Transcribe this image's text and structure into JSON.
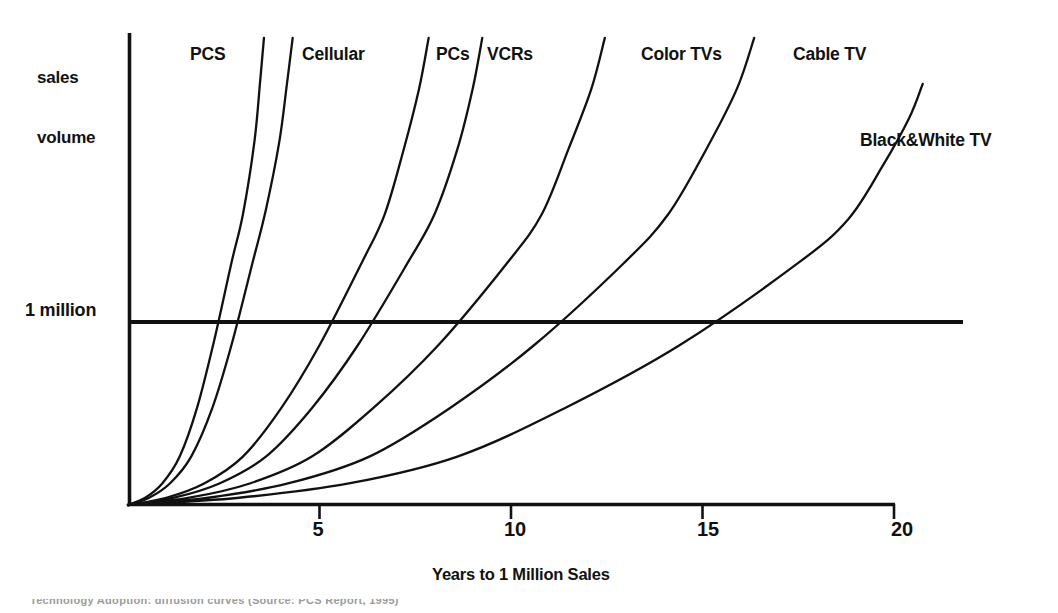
{
  "figure": {
    "y_axis_name_line1": "sales",
    "y_axis_name_line2": "volume",
    "y_reference_label": "1 million",
    "x_axis_title": "Years to 1 Million Sales",
    "bottom_caption": "Technology Adoption: diffusion curves (Source: PCS Report, 1995)"
  },
  "ticks": {
    "t5": "5",
    "t10": "10",
    "t15": "15",
    "t20": "20"
  },
  "labels": {
    "pcs": "PCS",
    "cellular": "Cellular",
    "pcs_computers": "PCs",
    "vcrs": "VCRs",
    "color_tvs": "Color TVs",
    "cable_tv": "Cable TV",
    "bw_tv": "Black&White TV"
  },
  "colors": {
    "ink": "#111111",
    "background": "#ffffff",
    "caption": "#9b9b9b"
  },
  "chart_data": {
    "type": "line",
    "title": "",
    "subtitle": "",
    "xlabel": "Years to 1 Million Sales",
    "ylabel": "sales volume",
    "xlim": [
      0,
      21.2
    ],
    "ylim": [
      0,
      1.95
    ],
    "grid": false,
    "legend": "inline-labels",
    "x_ticks": [
      5,
      10,
      15,
      20
    ],
    "x_tick_labels": [
      "5",
      "10",
      "15",
      "20"
    ],
    "y_reference_lines": [
      {
        "value": 1.0,
        "label": "1 million"
      }
    ],
    "annotation": "Each curve is an S-shaped diffusion curve; the year at which it crosses the 1 million line is the adoption speed.",
    "series": [
      {
        "name": "PCS",
        "years_to_1_million": 2.7,
        "x": [
          0.0,
          0.45,
          0.9,
          1.35,
          1.8,
          2.25,
          2.7,
          3.0,
          3.3,
          3.45,
          3.55
        ],
        "y": [
          0.0,
          0.03,
          0.09,
          0.2,
          0.4,
          0.68,
          1.0,
          1.2,
          1.5,
          1.75,
          1.93
        ]
      },
      {
        "name": "Cellular",
        "years_to_1_million": 3.25,
        "x": [
          0.0,
          0.55,
          1.1,
          1.65,
          2.2,
          2.7,
          3.25,
          3.6,
          3.95,
          4.15,
          4.3
        ],
        "y": [
          0.0,
          0.03,
          0.09,
          0.2,
          0.4,
          0.66,
          1.0,
          1.22,
          1.5,
          1.74,
          1.93
        ]
      },
      {
        "name": "PCs",
        "years_to_1_million": 6.1,
        "x": [
          0.0,
          1.0,
          2.0,
          3.0,
          4.0,
          5.0,
          6.1,
          6.7,
          7.2,
          7.6,
          7.85
        ],
        "y": [
          0.0,
          0.03,
          0.09,
          0.2,
          0.4,
          0.66,
          1.0,
          1.2,
          1.47,
          1.72,
          1.93
        ]
      },
      {
        "name": "VCRs",
        "years_to_1_million": 7.3,
        "x": [
          0.0,
          1.2,
          2.4,
          3.6,
          4.8,
          6.0,
          7.3,
          8.0,
          8.6,
          9.0,
          9.25
        ],
        "y": [
          0.0,
          0.03,
          0.09,
          0.2,
          0.4,
          0.66,
          1.0,
          1.2,
          1.47,
          1.72,
          1.93
        ]
      },
      {
        "name": "Color TVs",
        "years_to_1_million": 9.9,
        "x": [
          0.0,
          1.6,
          3.2,
          4.8,
          6.4,
          8.1,
          9.9,
          10.8,
          11.5,
          12.1,
          12.45
        ],
        "y": [
          0.0,
          0.03,
          0.09,
          0.2,
          0.4,
          0.66,
          1.0,
          1.2,
          1.47,
          1.72,
          1.93
        ]
      },
      {
        "name": "Cable TV",
        "years_to_1_million": 12.95,
        "x": [
          0.0,
          2.1,
          4.2,
          6.3,
          8.4,
          10.6,
          12.95,
          14.1,
          15.1,
          15.9,
          16.35
        ],
        "y": [
          0.0,
          0.03,
          0.09,
          0.2,
          0.4,
          0.66,
          1.0,
          1.2,
          1.47,
          1.72,
          1.93
        ]
      },
      {
        "name": "Black&White TV",
        "years_to_1_million": 17.5,
        "x": [
          0.0,
          2.9,
          5.8,
          8.6,
          11.4,
          14.4,
          17.5,
          18.8,
          19.7,
          20.4,
          20.75
        ],
        "y": [
          0.0,
          0.03,
          0.09,
          0.2,
          0.4,
          0.66,
          1.0,
          1.18,
          1.4,
          1.6,
          1.74
        ]
      }
    ]
  }
}
